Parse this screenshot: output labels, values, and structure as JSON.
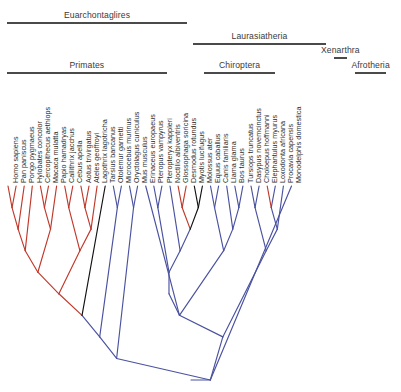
{
  "figure": {
    "type": "phylogenetic-cladogram",
    "width": 401,
    "height": 392,
    "root": {
      "x": 191,
      "y": 380
    },
    "tip_baseline_y": 186,
    "tip_spacing": 8.1,
    "first_tip_x": 8,
    "colors": {
      "red": "#c0392b",
      "blue": "#4a52a0",
      "black": "#111111",
      "rule": "#4a4a4a",
      "label": "#2b2b2b"
    }
  },
  "clade_bars": [
    {
      "name": "Euarchontoglires",
      "label": "Euarchontaglires",
      "x1": 7,
      "x2": 187,
      "bar_y": 22,
      "label_y": 10
    },
    {
      "name": "Laurasiatheria",
      "label": "Laurasiatheria",
      "x1": 193,
      "x2": 326,
      "bar_y": 43,
      "label_y": 31
    },
    {
      "name": "Xenarthra",
      "label": "Xenarthra",
      "x1": 334,
      "x2": 347,
      "bar_y": 57,
      "label_y": 45
    },
    {
      "name": "Primates",
      "label": "Primates",
      "x1": 7,
      "x2": 167,
      "bar_y": 72,
      "label_y": 60
    },
    {
      "name": "Chiroptera",
      "label": "Chiroptera",
      "x1": 204,
      "x2": 275,
      "bar_y": 72,
      "label_y": 60
    },
    {
      "name": "Afrotheria",
      "label": "Afrotheria",
      "x1": 355,
      "x2": 386,
      "bar_y": 72,
      "label_y": 60
    }
  ],
  "chart_data": {
    "type": "tree",
    "title": "",
    "tip_count": 46,
    "tips": [
      {
        "i": 0,
        "name": "Homo sapiens",
        "color": "red"
      },
      {
        "i": 1,
        "name": "Pan paniscus",
        "color": "red"
      },
      {
        "i": 2,
        "name": "Pongo pygmaeus",
        "color": "red"
      },
      {
        "i": 3,
        "name": "Hylobates concolor",
        "color": "red"
      },
      {
        "i": 4,
        "name": "Cercopithecus aethiops",
        "color": "red"
      },
      {
        "i": 5,
        "name": "Macaca mulatta",
        "color": "red"
      },
      {
        "i": 6,
        "name": "Papio hamadryas",
        "color": "red"
      },
      {
        "i": 7,
        "name": "Callithrix jacchus",
        "color": "red"
      },
      {
        "i": 8,
        "name": "Cebus apella",
        "color": "red"
      },
      {
        "i": 9,
        "name": "Aotus trivirgatus",
        "color": "red"
      },
      {
        "i": 10,
        "name": "Ateles geoffroyi",
        "color": "red"
      },
      {
        "i": 11,
        "name": "Lagothrix lagotricha",
        "color": "red"
      },
      {
        "i": 12,
        "name": "Tarsius bancanus",
        "color": "black"
      },
      {
        "i": 13,
        "name": "Otolemur garnetti",
        "color": "blue"
      },
      {
        "i": 14,
        "name": "Microcebus murinus",
        "color": "blue"
      },
      {
        "i": 15,
        "name": "Oryctolagus cuniculus",
        "color": "blue"
      },
      {
        "i": 16,
        "name": "Mus musculus",
        "color": "blue"
      },
      {
        "i": 17,
        "name": "Erinaceus europaeus",
        "color": "blue"
      },
      {
        "i": 18,
        "name": "Pteropus vampyrus",
        "color": "blue"
      },
      {
        "i": 19,
        "name": "Pteropteryx kappleri",
        "color": "blue"
      },
      {
        "i": 20,
        "name": "Noctilio albiventris",
        "color": "blue"
      },
      {
        "i": 21,
        "name": "Glossophaga soricina",
        "color": "red"
      },
      {
        "i": 22,
        "name": "Desmodus rotundus",
        "color": "red"
      },
      {
        "i": 23,
        "name": "Myotis lucifugus",
        "color": "black"
      },
      {
        "i": 24,
        "name": "Molossus ater",
        "color": "black"
      },
      {
        "i": 25,
        "name": "Equus caballus",
        "color": "blue"
      },
      {
        "i": 26,
        "name": "Canis familiaris",
        "color": "blue"
      },
      {
        "i": 27,
        "name": "Llama glama",
        "color": "blue"
      },
      {
        "i": 28,
        "name": "Bos taurus",
        "color": "blue"
      },
      {
        "i": 29,
        "name": "Tursiops truncatus",
        "color": "blue"
      },
      {
        "i": 30,
        "name": "Dasypus novemcinctus",
        "color": "blue"
      },
      {
        "i": 31,
        "name": "Choloepus hoffmanni",
        "color": "blue"
      },
      {
        "i": 32,
        "name": "Elephantulus myurus",
        "color": "red"
      },
      {
        "i": 33,
        "name": "Loxodonta africana",
        "color": "blue"
      },
      {
        "i": 34,
        "name": "Procavia capensis",
        "color": "blue"
      },
      {
        "i": 35,
        "name": "Monodelphis domestica",
        "color": "blue"
      }
    ],
    "newick": "(((((((((Homo_sapiens,Pan_paniscus),Pongo_pygmaeus),Hylobates_concolor),((Cercopithecus_aethiops,Macaca_mulatta),Papio_hamadryas)),((Callithrix_jacchus,Cebus_apella),((Aotus_trivirgatus,Ateles_geoffroyi),Lagothrix_lagotricha))),Tarsius_bancanus),(Otolemur_garnetti,Microcebus_murinus)),(Oryctolagus_cuniculus,Mus_musculus)),((Erinaceus_europaeus,(((Pteropus_vampyrus,Pteropteryx_kappleri),(Noctilio_albiventris,((Glossophaga_soricina,Desmodus_rotundus),(Myotis_lucifugus,Molossus_ater))))),((Equus_caballus,Canis_familiaris),(Llama_glama,(Bos_taurus,Tursiops_truncatus)))),((Dasypus_novemcinctus,Choloepus_hoffmanni),((Elephantulus_myurus,Loxodonta_africana),Procavia_capensis))),Monodelphis_domestica);"
  }
}
